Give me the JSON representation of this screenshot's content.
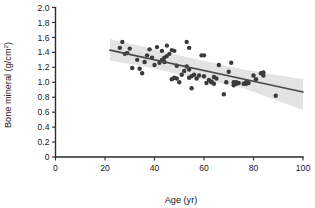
{
  "chart_data": {
    "type": "scatter",
    "title": "",
    "xlabel": "Age (yr)",
    "ylabel": "Bone mineral (g/cm2)",
    "ylabel_main": "Bone mineral (g/cm",
    "ylabel_sup": "2",
    "ylabel_tail": ")",
    "xlim": [
      0,
      100
    ],
    "ylim": [
      0,
      2.0
    ],
    "xticks": [
      0,
      20,
      40,
      60,
      80,
      100
    ],
    "xtick_labels": [
      "0",
      "20",
      "40",
      "60",
      "80",
      "100"
    ],
    "yticks": [
      0,
      0.2,
      0.4,
      0.6,
      0.8,
      1.0,
      1.2,
      1.4,
      1.6,
      1.8,
      2.0
    ],
    "ytick_labels": [
      "0",
      "0.2",
      "0.4",
      "0.6",
      "0.8",
      "1.0",
      "1.2",
      "1.4",
      "1.6",
      "1.8",
      "2.0"
    ],
    "grid": false,
    "legend": "none",
    "point_color": "#3a3a3a",
    "line_color": "#4a4a4a",
    "band_color": "#e3e3e3",
    "axis_color": "#2b2b2b",
    "marker_size": 2.2,
    "regression_line": {
      "x_start": 22,
      "y_start": 1.43,
      "x_end": 100,
      "y_end": 0.87,
      "slope": -0.00718,
      "intercept": 1.588
    },
    "confidence_band": {
      "x_start": 22,
      "x_end": 100,
      "upper": [
        [
          22,
          1.58
        ],
        [
          36,
          1.47
        ],
        [
          55,
          1.32
        ],
        [
          76,
          1.17
        ],
        [
          100,
          1.04
        ]
      ],
      "lower": [
        [
          22,
          1.29
        ],
        [
          36,
          1.21
        ],
        [
          55,
          1.07
        ],
        [
          76,
          0.92
        ],
        [
          100,
          0.63
        ]
      ]
    },
    "x": [
      26,
      27,
      28,
      29,
      30,
      31,
      33,
      34,
      35,
      36,
      37,
      38,
      39,
      40,
      41,
      42,
      43,
      43,
      44,
      44,
      45,
      45,
      46,
      47,
      47,
      48,
      48,
      49,
      49,
      50,
      51,
      52,
      53,
      53,
      54,
      54,
      54,
      55,
      55,
      56,
      57,
      58,
      59,
      60,
      60,
      61,
      62,
      63,
      63,
      64,
      64,
      65,
      66,
      68,
      69,
      70,
      71,
      72,
      72,
      73,
      73,
      74,
      76,
      77,
      77,
      78,
      80,
      81,
      83,
      84,
      84,
      89
    ],
    "y": [
      1.46,
      1.54,
      1.38,
      1.39,
      1.45,
      1.19,
      1.3,
      1.18,
      1.12,
      1.27,
      1.36,
      1.44,
      1.33,
      1.23,
      1.47,
      1.26,
      1.42,
      1.3,
      1.33,
      1.27,
      1.49,
      1.35,
      1.38,
      1.43,
      1.04,
      1.42,
      1.06,
      1.05,
      1.22,
      1.0,
      1.1,
      1.15,
      1.54,
      1.21,
      1.46,
      1.17,
      1.06,
      1.08,
      0.92,
      1.1,
      1.05,
      1.09,
      1.36,
      1.36,
      1.08,
      0.99,
      1.03,
      1.0,
      1.01,
      1.07,
      0.98,
      1.05,
      1.23,
      0.84,
      1.0,
      1.14,
      1.26,
      1.0,
      0.96,
      1.0,
      0.98,
      0.99,
      0.98,
      0.98,
      1.0,
      0.99,
      1.09,
      1.04,
      1.12,
      1.09,
      1.13,
      0.82
    ],
    "n_points": 72,
    "x_range_observed": [
      26,
      89
    ],
    "y_range_observed": [
      0.82,
      1.54
    ]
  }
}
